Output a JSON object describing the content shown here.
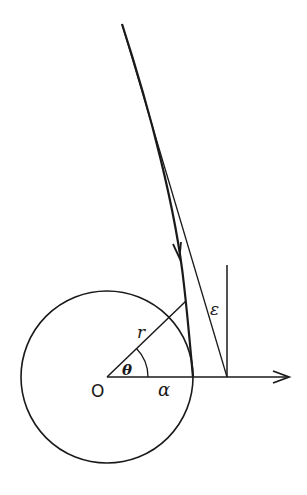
{
  "figure": {
    "type": "geometric-diagram",
    "stroke_color": "#1a1a1a",
    "background": "#ffffff"
  },
  "labels": {
    "origin": "O",
    "radius": "r",
    "angle": "θ",
    "circle_radius": "α",
    "deflection": "ε"
  },
  "geometry": {
    "center": [
      107,
      377
    ],
    "circle_radius_px": 86,
    "axis_end": [
      290,
      377
    ],
    "radius_line_end": [
      186,
      301
    ],
    "vertical_line": {
      "x": 227,
      "y_top": 265,
      "y_bottom": 377
    },
    "asymptote": {
      "start": [
        122,
        24
      ],
      "end": [
        227,
        377
      ]
    },
    "trajectory": {
      "start": [
        122,
        24
      ],
      "end": [
        193,
        377
      ]
    },
    "trajectory_arrow_at": [
      179,
      255
    ]
  }
}
